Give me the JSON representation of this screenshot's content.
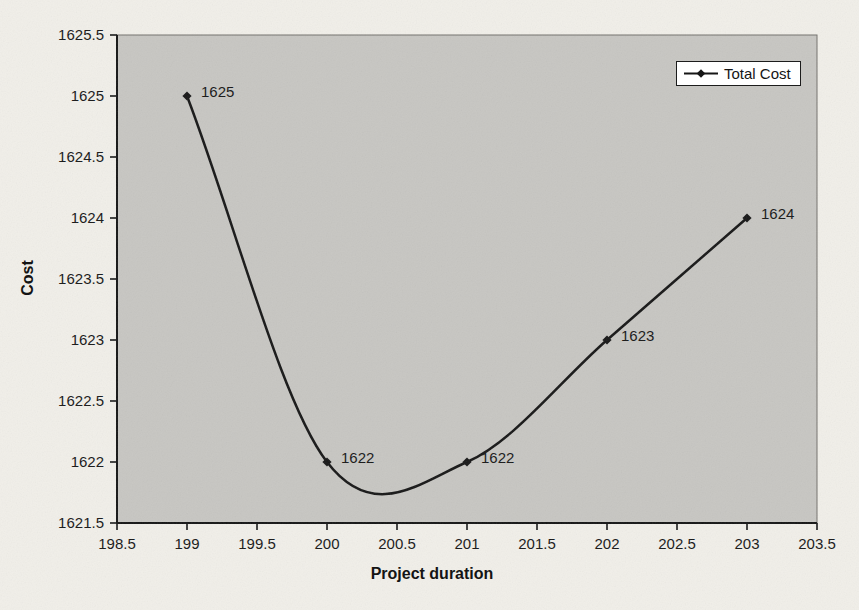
{
  "page": {
    "background": "#f1efe9"
  },
  "chart_data": {
    "type": "line",
    "subtype": "smooth-scatter-with-markers",
    "title": "",
    "xlabel": "Project duration",
    "ylabel": "Cost",
    "series": [
      {
        "name": "Total Cost",
        "x": [
          199,
          200,
          201,
          202,
          203
        ],
        "y": [
          1625,
          1622,
          1622,
          1623,
          1624
        ],
        "point_labels": [
          "1625",
          "1622",
          "1622",
          "1623",
          "1624"
        ],
        "marker": "diamond"
      }
    ],
    "xlim": [
      198.5,
      203.5
    ],
    "ylim": [
      1621.5,
      1625.5
    ],
    "x_tick_step": 0.5,
    "y_tick_step": 0.5,
    "x_ticks": [
      "198.5",
      "199",
      "199.5",
      "200",
      "200.5",
      "201",
      "201.5",
      "202",
      "202.5",
      "203",
      "203.5"
    ],
    "y_ticks": [
      "1621.5",
      "1622",
      "1622.5",
      "1623",
      "1623.5",
      "1624",
      "1624.5",
      "1625",
      "1625.5"
    ],
    "grid": false,
    "smooth": true,
    "legend_position": "top-right-inside",
    "colors": {
      "line": "#161616",
      "marker": "#161616",
      "plot_bg": "#c7c6c2",
      "plot_border": "#72716d",
      "axis": "#141414",
      "legend_bg": "#ffffff",
      "legend_border": "#1c1c1c",
      "page_bg": "#f1efe9",
      "text": "#161616"
    }
  }
}
